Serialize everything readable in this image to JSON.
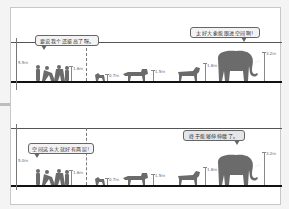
{
  "panels": [
    {
      "ceiling_height_label": "5.5m",
      "bubble_left_text": "要说我个还挺高了呀。",
      "bubble_right_text": "太好大象能跟进空间啊!",
      "labels": {
        "people": "1.6m",
        "dog": "0.7m",
        "zebra": "1.5m",
        "post": "1.8m",
        "elephant": "3.2m"
      }
    },
    {
      "ceiling_height_label": "5.0m",
      "bubble_left_text": "空间这么大就好有两层!",
      "bubble_right_text": "终于能够伸伸腰了。",
      "labels": {
        "people": "1.6m",
        "dog": "0.7m",
        "zebra": "1.5m",
        "post": "1.8m",
        "elephant": "3.2m"
      }
    }
  ],
  "colors": {
    "frame_border": "#c8c8c8",
    "floor": "#111111",
    "ceiling": "#555555",
    "silhouette": "#6b6b6b",
    "bubble_fill": "#f3f3f3"
  },
  "figures": [
    "people",
    "dog",
    "lion",
    "zebra",
    "elephant"
  ]
}
